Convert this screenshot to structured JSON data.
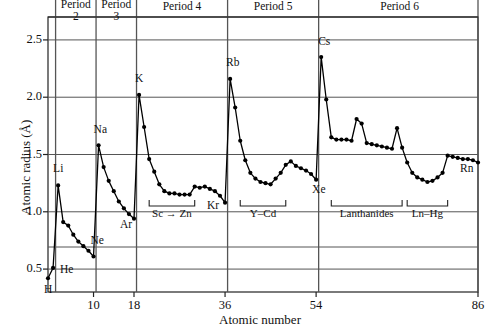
{
  "figure": {
    "title": "",
    "x_axis_label": "Atomic number",
    "y_axis_label": "Atomic radius (Å)"
  },
  "chart_data": {
    "type": "line",
    "title": "",
    "xlabel": "Atomic number",
    "ylabel": "Atomic radius (Å)",
    "xlim": [
      1,
      86
    ],
    "ylim": [
      0.3,
      2.7
    ],
    "grid": true,
    "legend": "none",
    "x_ticks": [
      10,
      18,
      36,
      54,
      86
    ],
    "y_ticks": [
      0.5,
      1.0,
      1.5,
      2.0,
      2.5
    ],
    "series_name": "Atomic radius",
    "marker": "filled-circle",
    "x": [
      1,
      2,
      3,
      4,
      5,
      6,
      7,
      8,
      9,
      10,
      11,
      12,
      13,
      14,
      15,
      16,
      17,
      18,
      19,
      20,
      21,
      22,
      23,
      24,
      25,
      26,
      27,
      28,
      29,
      30,
      31,
      32,
      33,
      34,
      35,
      36,
      37,
      38,
      39,
      40,
      41,
      42,
      43,
      44,
      45,
      46,
      47,
      48,
      49,
      50,
      51,
      52,
      53,
      54,
      55,
      56,
      57,
      58,
      59,
      60,
      61,
      62,
      63,
      64,
      65,
      66,
      67,
      68,
      69,
      70,
      71,
      72,
      73,
      74,
      75,
      76,
      77,
      78,
      79,
      80,
      81,
      82,
      83,
      84,
      85,
      86
    ],
    "y": [
      0.42,
      0.51,
      1.23,
      0.91,
      0.88,
      0.8,
      0.74,
      0.7,
      0.66,
      0.61,
      1.58,
      1.39,
      1.27,
      1.18,
      1.09,
      1.03,
      0.98,
      0.94,
      2.02,
      1.74,
      1.46,
      1.35,
      1.24,
      1.18,
      1.16,
      1.16,
      1.15,
      1.15,
      1.15,
      1.22,
      1.21,
      1.22,
      1.2,
      1.18,
      1.14,
      1.08,
      2.16,
      1.91,
      1.62,
      1.45,
      1.34,
      1.29,
      1.26,
      1.25,
      1.24,
      1.29,
      1.34,
      1.41,
      1.44,
      1.4,
      1.38,
      1.36,
      1.33,
      1.28,
      2.35,
      1.98,
      1.65,
      1.63,
      1.63,
      1.63,
      1.62,
      1.81,
      1.77,
      1.6,
      1.59,
      1.58,
      1.57,
      1.56,
      1.55,
      1.73,
      1.56,
      1.43,
      1.34,
      1.3,
      1.28,
      1.26,
      1.27,
      1.3,
      1.34,
      1.49,
      1.48,
      1.47,
      1.46,
      1.46,
      1.45,
      1.43
    ],
    "period_bands": [
      {
        "label": "Period",
        "sub": "2",
        "x_start": 3,
        "x_end": 10
      },
      {
        "label": "Period",
        "sub": "3",
        "x_start": 11,
        "x_end": 18
      },
      {
        "label": "Period 4",
        "sub": "",
        "x_start": 19,
        "x_end": 36
      },
      {
        "label": "Period 5",
        "sub": "",
        "x_start": 37,
        "x_end": 54
      },
      {
        "label": "Period 6",
        "sub": "",
        "x_start": 55,
        "x_end": 86
      }
    ],
    "point_labels": [
      {
        "text": "H",
        "x": 1,
        "y": 0.42
      },
      {
        "text": "He",
        "x": 2,
        "y": 0.51
      },
      {
        "text": "Li",
        "x": 3,
        "y": 1.23
      },
      {
        "text": "Ne",
        "x": 10,
        "y": 0.61
      },
      {
        "text": "Na",
        "x": 11,
        "y": 1.58
      },
      {
        "text": "Ar",
        "x": 18,
        "y": 0.94
      },
      {
        "text": "K",
        "x": 19,
        "y": 2.02
      },
      {
        "text": "Kr",
        "x": 36,
        "y": 1.08
      },
      {
        "text": "Rb",
        "x": 37,
        "y": 2.16
      },
      {
        "text": "Xe",
        "x": 54,
        "y": 1.28
      },
      {
        "text": "Cs",
        "x": 55,
        "y": 2.35
      },
      {
        "text": "Rn",
        "x": 86,
        "y": 1.43
      }
    ],
    "bracket_annotations": [
      {
        "text": "Sc → Zn",
        "x_start": 21,
        "x_end": 30
      },
      {
        "text": "Y–Cd",
        "x_start": 39,
        "x_end": 48
      },
      {
        "text": "Lanthanides",
        "x_start": 57,
        "x_end": 71
      },
      {
        "text": "Ln–Hg",
        "x_start": 72,
        "x_end": 80
      }
    ]
  },
  "colors": {
    "line": "#000000",
    "marker": "#000000",
    "grid": "#555555",
    "axis": "#222222",
    "background": "#ffffff"
  }
}
